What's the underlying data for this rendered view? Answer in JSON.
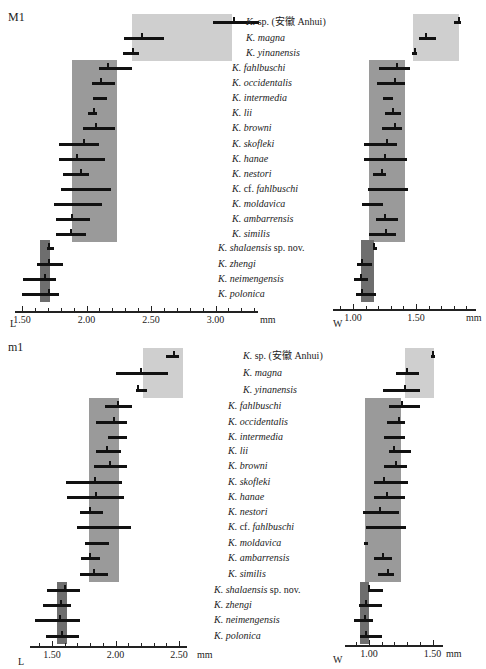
{
  "top_clipped_text": "",
  "species": [
    {
      "name": "K.",
      "epithet": "sp. (安徽 Anhui)",
      "italic_epithet": false,
      "indent": 1
    },
    {
      "name": "K.",
      "epithet": "magna",
      "italic_epithet": true,
      "indent": 1
    },
    {
      "name": "K.",
      "epithet": "yinanensis",
      "italic_epithet": true,
      "indent": 1
    },
    {
      "name": "K.",
      "epithet": "fahlbuschi",
      "italic_epithet": true,
      "indent": 0
    },
    {
      "name": "K.",
      "epithet": "occidentalis",
      "italic_epithet": true,
      "indent": 0
    },
    {
      "name": "K.",
      "epithet": "intermedia",
      "italic_epithet": true,
      "indent": 0
    },
    {
      "name": "K.",
      "epithet": "lii",
      "italic_epithet": true,
      "indent": 0
    },
    {
      "name": "K.",
      "epithet": "browni",
      "italic_epithet": true,
      "indent": 0
    },
    {
      "name": "K.",
      "epithet": "skofleki",
      "italic_epithet": true,
      "indent": 0
    },
    {
      "name": "K.",
      "epithet": "hanae",
      "italic_epithet": true,
      "indent": 0
    },
    {
      "name": "K.",
      "epithet": "nestori",
      "italic_epithet": true,
      "indent": 0
    },
    {
      "name": "K.",
      "epithet": "cf. fahlbuschi",
      "italic_epithet": true,
      "indent": 0
    },
    {
      "name": "K.",
      "epithet": "moldavica",
      "italic_epithet": true,
      "indent": 0
    },
    {
      "name": "K.",
      "epithet": "ambarrensis",
      "italic_epithet": true,
      "indent": 0
    },
    {
      "name": "K.",
      "epithet": "similis",
      "italic_epithet": true,
      "indent": 0
    },
    {
      "name": "K.",
      "epithet": "shalaensis sp. nov.",
      "italic_epithet": true,
      "indent": -1
    },
    {
      "name": "K.",
      "epithet": "zhengi",
      "italic_epithet": true,
      "indent": -1
    },
    {
      "name": "K.",
      "epithet": "neimengensis",
      "italic_epithet": true,
      "indent": -1
    },
    {
      "name": "K.",
      "epithet": "polonica",
      "italic_epithet": true,
      "indent": -1
    }
  ],
  "colors": {
    "light_shade": "#cfcfcf",
    "mid_shade": "#9a9a9a",
    "dark_shade": "#6e6e6e",
    "bar": "#111111"
  },
  "chart_data": [
    {
      "type": "range-bar",
      "panel": "M1",
      "title": "M1",
      "xlabel": "L",
      "unit": "mm",
      "ticks": [
        "1.50",
        "2.00",
        "2.50",
        "3.00"
      ],
      "xlim": [
        1.45,
        3.4
      ],
      "categories": [
        "K. sp. (安徽 Anhui)",
        "K. magna",
        "K. yinanensis",
        "K. fahlbuschi",
        "K. occidentalis",
        "K. intermedia",
        "K. lii",
        "K. browni",
        "K. skofleki",
        "K. hanae",
        "K. nestori",
        "K. cf. fahlbuschi",
        "K. moldavica",
        "K. ambarrensis",
        "K. similis",
        "K. shalaensis sp. nov.",
        "K. zhengi",
        "K. neimengensis",
        "K. polonica"
      ],
      "min": [
        2.98,
        2.29,
        2.28,
        2.1,
        2.04,
        2.05,
        2.01,
        1.97,
        1.79,
        1.79,
        1.82,
        1.8,
        1.75,
        1.76,
        1.76,
        1.69,
        1.62,
        1.51,
        1.5
      ],
      "max": [
        3.34,
        2.6,
        2.41,
        2.35,
        2.22,
        2.16,
        2.08,
        2.22,
        2.1,
        2.14,
        2.02,
        2.19,
        2.12,
        2.03,
        2.0,
        1.75,
        1.82,
        1.76,
        1.79
      ],
      "mean": [
        3.14,
        2.43,
        2.36,
        2.17,
        2.11,
        null,
        2.06,
        2.07,
        1.98,
        1.93,
        1.96,
        null,
        null,
        1.89,
        1.88,
        1.71,
        1.71,
        1.68,
        1.71
      ],
      "shaded_groups": [
        {
          "rows": [
            0,
            2
          ],
          "from": 2.35,
          "to": 3.13,
          "shade": "light"
        },
        {
          "rows": [
            3,
            14
          ],
          "from": 1.89,
          "to": 2.24,
          "shade": "mid"
        },
        {
          "rows": [
            15,
            18
          ],
          "from": 1.64,
          "to": 1.72,
          "shade": "dark"
        }
      ]
    },
    {
      "type": "range-bar",
      "panel": "M1",
      "xlabel": "W",
      "unit": "mm",
      "ticks": [
        "1.00",
        "1.50"
      ],
      "xlim": [
        0.85,
        1.95
      ],
      "categories": [
        "K. sp. (安徽 Anhui)",
        "K. magna",
        "K. yinanensis",
        "K. fahlbuschi",
        "K. occidentalis",
        "K. intermedia",
        "K. lii",
        "K. browni",
        "K. skofleki",
        "K. hanae",
        "K. nestori",
        "K. cf. fahlbuschi",
        "K. moldavica",
        "K. ambarrensis",
        "K. similis",
        "K. shalaensis sp. nov.",
        "K. zhengi",
        "K. neimengensis",
        "K. polonica"
      ],
      "min": [
        1.8,
        1.52,
        1.47,
        1.21,
        1.19,
        1.24,
        1.25,
        1.23,
        1.09,
        1.09,
        1.16,
        1.12,
        1.07,
        1.18,
        1.13,
        1.16,
        1.03,
        1.01,
        1.02
      ],
      "max": [
        1.86,
        1.66,
        1.51,
        1.45,
        1.41,
        1.32,
        1.38,
        1.39,
        1.35,
        1.43,
        1.26,
        1.44,
        1.24,
        1.36,
        1.34,
        1.17,
        1.15,
        1.12,
        1.18
      ],
      "mean": [
        1.84,
        1.58,
        1.49,
        1.35,
        1.33,
        null,
        1.32,
        1.33,
        1.27,
        1.25,
        1.23,
        null,
        null,
        1.25,
        1.26,
        1.17,
        1.07,
        1.06,
        1.07
      ],
      "shaded_groups": [
        {
          "rows": [
            0,
            2
          ],
          "from": 1.48,
          "to": 1.84,
          "shade": "light"
        },
        {
          "rows": [
            3,
            14
          ],
          "from": 1.13,
          "to": 1.41,
          "shade": "mid"
        },
        {
          "rows": [
            15,
            18
          ],
          "from": 1.06,
          "to": 1.17,
          "shade": "dark"
        }
      ]
    },
    {
      "type": "range-bar",
      "panel": "m1",
      "title": "m1",
      "xlabel": "L",
      "unit": "mm",
      "ticks": [
        "1.50",
        "2.00",
        "2.50"
      ],
      "xlim": [
        1.32,
        2.62
      ],
      "categories": [
        "K. sp. (安徽 Anhui)",
        "K. magna",
        "K. yinanensis",
        "K. fahlbuschi",
        "K. occidentalis",
        "K. intermedia",
        "K. lii",
        "K. browni",
        "K. skofleki",
        "K. hanae",
        "K. nestori",
        "K. cf. fahlbuschi",
        "K. moldavica",
        "K. ambarrensis",
        "K. similis",
        "K. shalaensis sp. nov.",
        "K. zhengi",
        "K. neimengensis",
        "K. polonica"
      ],
      "min": [
        2.4,
        2.0,
        2.16,
        1.92,
        1.85,
        1.94,
        1.85,
        1.83,
        1.61,
        1.62,
        1.72,
        1.7,
        1.76,
        1.73,
        1.72,
        1.46,
        1.43,
        1.37,
        1.45
      ],
      "max": [
        2.5,
        2.41,
        2.25,
        2.13,
        2.09,
        2.09,
        2.04,
        2.09,
        2.05,
        2.07,
        1.9,
        2.12,
        1.95,
        1.88,
        1.94,
        1.72,
        1.65,
        1.72,
        1.71
      ],
      "mean": [
        2.46,
        2.2,
        2.18,
        2.02,
        1.99,
        null,
        1.93,
        1.96,
        1.84,
        1.85,
        1.8,
        null,
        null,
        1.8,
        1.83,
        1.6,
        1.57,
        1.56,
        1.58
      ],
      "shaded_groups": [
        {
          "rows": [
            0,
            2
          ],
          "from": 2.22,
          "to": 2.53,
          "shade": "light"
        },
        {
          "rows": [
            3,
            14
          ],
          "from": 1.79,
          "to": 2.03,
          "shade": "mid"
        },
        {
          "rows": [
            15,
            18
          ],
          "from": 1.54,
          "to": 1.62,
          "shade": "dark"
        }
      ]
    },
    {
      "type": "range-bar",
      "panel": "m1",
      "xlabel": "W",
      "unit": "mm",
      "ticks": [
        "1.00",
        "1.50"
      ],
      "xlim": [
        0.8,
        1.6
      ],
      "categories": [
        "K. sp. (安徽 Anhui)",
        "K. magna",
        "K. yinanensis",
        "K. fahlbuschi",
        "K. occidentalis",
        "K. intermedia",
        "K. lii",
        "K. browni",
        "K. skofleki",
        "K. hanae",
        "K. nestori",
        "K. cf. fahlbuschi",
        "K. moldavica",
        "K. ambarrensis",
        "K. similis",
        "K. shalaensis sp. nov.",
        "K. zhengi",
        "K. neimengensis",
        "K. polonica"
      ],
      "min": [
        1.49,
        1.21,
        1.11,
        1.16,
        1.14,
        1.12,
        1.16,
        1.12,
        1.04,
        1.04,
        0.95,
        0.98,
        0.96,
        1.04,
        1.07,
        0.99,
        0.92,
        0.88,
        0.93
      ],
      "max": [
        1.5,
        1.39,
        1.4,
        1.4,
        1.28,
        1.28,
        1.33,
        1.3,
        1.31,
        1.28,
        1.24,
        1.29,
        0.99,
        1.18,
        1.2,
        1.11,
        1.1,
        1.03,
        1.1
      ],
      "mean": [
        1.5,
        1.3,
        1.28,
        1.26,
        1.24,
        null,
        1.2,
        1.21,
        1.12,
        1.14,
        1.09,
        null,
        null,
        1.11,
        1.15,
        1.0,
        0.98,
        0.97,
        0.98
      ],
      "shaded_groups": [
        {
          "rows": [
            0,
            2
          ],
          "from": 1.28,
          "to": 1.51,
          "shade": "light"
        },
        {
          "rows": [
            3,
            14
          ],
          "from": 0.97,
          "to": 1.25,
          "shade": "mid"
        },
        {
          "rows": [
            15,
            18
          ],
          "from": 0.93,
          "to": 1.0,
          "shade": "dark"
        }
      ]
    }
  ],
  "panels": [
    {
      "title": "M1",
      "axis_L_label": "L",
      "axis_W_label": "W",
      "unit": "mm"
    },
    {
      "title": "m1",
      "axis_L_label": "L",
      "axis_W_label": "W",
      "unit": "mm"
    }
  ]
}
